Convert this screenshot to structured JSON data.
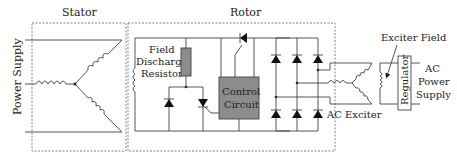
{
  "diagram": {
    "type": "synchronous motor excitation system schematic",
    "sections": {
      "stator": "Stator",
      "rotor": "Rotor"
    },
    "labels": {
      "power_supply": "Power Supply",
      "field_discharge_resistor_line1": "Field",
      "field_discharge_resistor_line2": "Discharge",
      "field_discharge_resistor_line3": "Resistor",
      "control_circuit_line1": "Control",
      "control_circuit_line2": "Circuit",
      "ac_exciter": "AC Exciter",
      "exciter_field": "Exciter Field",
      "regulator": "Regulator",
      "ac_power_supply_line1": "AC",
      "ac_power_supply_line2": "Power",
      "ac_power_supply_line3": "Supply"
    },
    "colors": {
      "component_fill": "#8c8c8c",
      "wire": "#444444",
      "background": "#ffffff"
    }
  }
}
